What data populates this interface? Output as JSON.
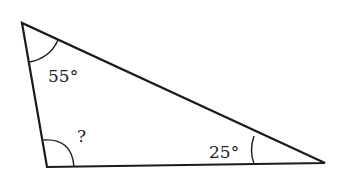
{
  "diagram": {
    "type": "triangle",
    "vertices": {
      "top_left": [
        22,
        23
      ],
      "bottom_left": [
        47,
        167
      ],
      "right": [
        325,
        163
      ]
    },
    "angles": [
      {
        "vertex": "top_left",
        "label": "55°"
      },
      {
        "vertex": "bottom_left",
        "label": "?"
      },
      {
        "vertex": "right",
        "label": "25°"
      }
    ],
    "colors": {
      "stroke": "#1a1a1a",
      "background": "#ffffff"
    }
  }
}
